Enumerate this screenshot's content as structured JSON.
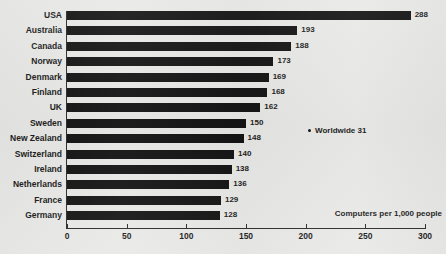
{
  "chart_data": {
    "type": "bar",
    "orientation": "horizontal",
    "title": "",
    "subtitle": "",
    "xlabel": "Computers per 1,000 people",
    "ylabel": "",
    "xlim": [
      0,
      300
    ],
    "xticks": [
      0,
      50,
      100,
      150,
      200,
      250,
      300
    ],
    "xtick_labels": [
      "0",
      "50",
      "100",
      "150",
      "200",
      "250",
      "300"
    ],
    "grid": false,
    "legend": null,
    "categories": [
      "USA",
      "Australia",
      "Canada",
      "Norway",
      "Denmark",
      "Finland",
      "UK",
      "Sweden",
      "New Zealand",
      "Switzerland",
      "Ireland",
      "Netherlands",
      "France",
      "Germany"
    ],
    "values": [
      288,
      193,
      188,
      173,
      169,
      168,
      162,
      150,
      148,
      140,
      138,
      136,
      129,
      128
    ],
    "value_labels": [
      "288",
      "193",
      "188",
      "173",
      "169",
      "168",
      "162",
      "150",
      "148",
      "140",
      "138",
      "136",
      "129",
      "128"
    ],
    "annotations": [
      {
        "marker": "dot",
        "label": "Worldwide 31",
        "value": 31
      }
    ],
    "colors": {
      "bar": "#141414",
      "text": "#1b1b1b",
      "axis": "#2b2b2b",
      "background": "#e9e9e7"
    }
  },
  "axis_caption": "Computers per 1,000 people",
  "worldwide": {
    "label": "Worldwide 31"
  }
}
